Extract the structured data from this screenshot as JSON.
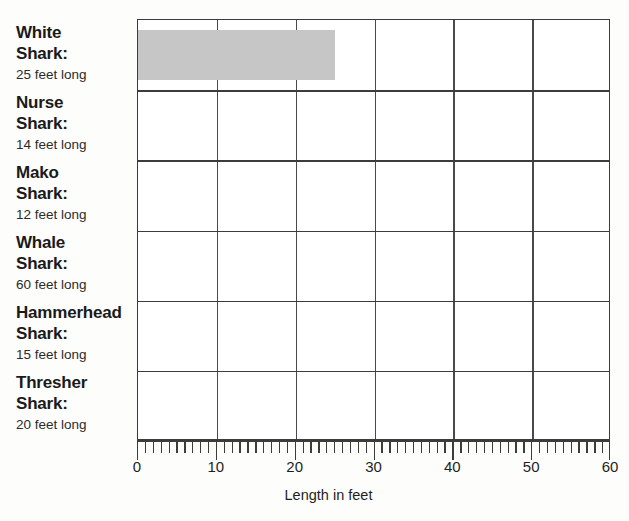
{
  "chart_data": {
    "type": "bar",
    "orientation": "horizontal",
    "title": "",
    "xlabel": "Length in feet",
    "ylabel": "",
    "xlim": [
      0,
      60
    ],
    "xticks": [
      0,
      10,
      20,
      30,
      40,
      50,
      60
    ],
    "xtick_labels": [
      "0",
      "10",
      "20",
      "30",
      "40",
      "50",
      "60"
    ],
    "minor_tick_interval": 1,
    "grid": true,
    "legend": "none",
    "bar_color": "#c6c6c6",
    "categories": [
      "White Shark:",
      "Nurse Shark:",
      "Mako Shark:",
      "Whale Shark:",
      "Hammerhead Shark:",
      "Thresher Shark:"
    ],
    "values": [
      25,
      14,
      12,
      60,
      15,
      20
    ],
    "drawn_values": [
      25,
      null,
      null,
      null,
      null,
      null
    ],
    "value_labels": [
      "25 feet long",
      "14 feet long",
      "12 feet long",
      "60 feet long",
      "15 feet long",
      "20 feet long"
    ]
  },
  "categories": [
    {
      "name_line1": "White",
      "name_line2": "Shark:",
      "sub": "25 feet long",
      "value": 25,
      "drawn": true
    },
    {
      "name_line1": "Nurse",
      "name_line2": "Shark:",
      "sub": "14 feet long",
      "value": 14,
      "drawn": false
    },
    {
      "name_line1": "Mako",
      "name_line2": "Shark:",
      "sub": "12 feet long",
      "value": 12,
      "drawn": false
    },
    {
      "name_line1": "Whale",
      "name_line2": "Shark:",
      "sub": "60 feet long",
      "value": 60,
      "drawn": false
    },
    {
      "name_line1": "Hammerhead",
      "name_line2": "Shark:",
      "sub": "15 feet long",
      "value": 15,
      "drawn": false
    },
    {
      "name_line1": "Thresher",
      "name_line2": "Shark:",
      "sub": "20 feet long",
      "value": 20,
      "drawn": false
    }
  ],
  "axis": {
    "title": "Length in feet",
    "tick_labels": [
      "0",
      "10",
      "20",
      "30",
      "40",
      "50",
      "60"
    ]
  },
  "colors": {
    "bar": "#c6c6c6",
    "grid": "#4a4a4a",
    "frame": "#3c3c3c",
    "text": "#1a1a1a",
    "background": "#fdfdfb"
  }
}
